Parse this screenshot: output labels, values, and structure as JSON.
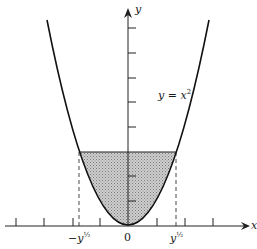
{
  "diagram": {
    "type": "function-plot",
    "curve": {
      "equation_label": "y = x",
      "equation_exponent": "2",
      "color": "#111111"
    },
    "axes": {
      "x_label": "x",
      "y_label": "y",
      "origin_label": "0",
      "neg_root_label": "−y",
      "pos_root_label": "y",
      "root_exponent": "½"
    },
    "shaded_region": {
      "description": "region between the parabola y = x^2 and the horizontal line at height y, from -y^1/2 to y^1/2",
      "fill": "#bdbdbd"
    },
    "dashed_lines": [
      "x = -y^1/2",
      "x = y^1/2"
    ],
    "x_ticks_count": 7,
    "y_ticks_count": 8
  }
}
